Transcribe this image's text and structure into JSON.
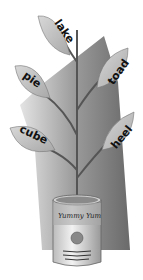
{
  "illustration": {
    "subject": "plant growing from can with word leaves",
    "leaves": [
      {
        "word": "lake"
      },
      {
        "word": "pie"
      },
      {
        "word": "toad"
      },
      {
        "word": "cube"
      },
      {
        "word": "heel"
      }
    ],
    "can": {
      "label": "Yummy Yum"
    }
  }
}
